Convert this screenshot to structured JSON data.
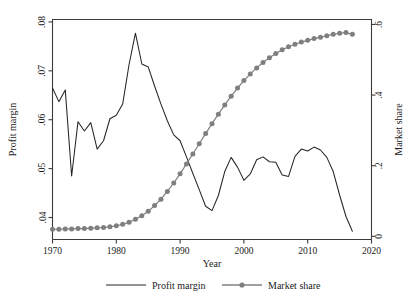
{
  "chart_data": {
    "type": "line",
    "title": "",
    "xlabel": "Year",
    "ylabel": "Profit margin",
    "y2label": "Market share",
    "xlim": [
      1970,
      2020
    ],
    "ylim": [
      0.0355,
      0.0805
    ],
    "y2lim": [
      -0.009,
      0.614
    ],
    "grid": false,
    "legend_position": "bottom-center",
    "xticks": [
      1970,
      1980,
      1990,
      2000,
      2010,
      2020
    ],
    "xticklabels": [
      "1970",
      "1980",
      "1990",
      "2000",
      "2010",
      "2020"
    ],
    "yticks": [
      0.04,
      0.05,
      0.06,
      0.07,
      0.08
    ],
    "yticklabels": [
      ".04",
      ".05",
      ".06",
      ".07",
      ".08"
    ],
    "y2ticks": [
      0,
      0.2,
      0.4,
      0.6
    ],
    "y2ticklabels": [
      "0",
      ".2",
      ".4",
      ".6"
    ],
    "x": [
      1970,
      1971,
      1972,
      1973,
      1974,
      1975,
      1976,
      1977,
      1978,
      1979,
      1980,
      1981,
      1982,
      1983,
      1984,
      1985,
      1986,
      1987,
      1988,
      1989,
      1990,
      1991,
      1992,
      1993,
      1994,
      1995,
      1996,
      1997,
      1998,
      1999,
      2000,
      2001,
      2002,
      2003,
      2004,
      2005,
      2006,
      2007,
      2008,
      2009,
      2010,
      2011,
      2012,
      2013,
      2014,
      2015,
      2016,
      2017
    ],
    "series": [
      {
        "name": "Profit margin",
        "axis": "left",
        "color": "#262626",
        "marker": "none",
        "values": [
          0.0665,
          0.0637,
          0.0661,
          0.0485,
          0.0596,
          0.0577,
          0.0594,
          0.054,
          0.0557,
          0.0602,
          0.0609,
          0.0632,
          0.0713,
          0.0777,
          0.0714,
          0.0708,
          0.0669,
          0.0632,
          0.0598,
          0.0569,
          0.0557,
          0.0524,
          0.049,
          0.0457,
          0.0423,
          0.0414,
          0.0445,
          0.0494,
          0.0523,
          0.0503,
          0.0476,
          0.0489,
          0.0518,
          0.0524,
          0.0514,
          0.0513,
          0.0487,
          0.0484,
          0.0525,
          0.054,
          0.0536,
          0.0544,
          0.0538,
          0.0523,
          0.0494,
          0.0446,
          0.0402,
          0.0372
        ]
      },
      {
        "name": "Market share",
        "axis": "right",
        "color": "#808080",
        "marker": "circle",
        "values": [
          0.02,
          0.02,
          0.021,
          0.021,
          0.022,
          0.022,
          0.023,
          0.024,
          0.025,
          0.027,
          0.03,
          0.034,
          0.04,
          0.048,
          0.058,
          0.071,
          0.087,
          0.105,
          0.127,
          0.151,
          0.177,
          0.205,
          0.233,
          0.262,
          0.291,
          0.319,
          0.346,
          0.372,
          0.397,
          0.42,
          0.441,
          0.46,
          0.477,
          0.492,
          0.506,
          0.518,
          0.528,
          0.537,
          0.544,
          0.55,
          0.555,
          0.56,
          0.564,
          0.568,
          0.572,
          0.575,
          0.577,
          0.572
        ]
      }
    ],
    "legend": [
      {
        "label": "Profit margin",
        "style": "line",
        "color": "#262626"
      },
      {
        "label": "Market share",
        "style": "line-marker",
        "color": "#808080"
      }
    ]
  }
}
